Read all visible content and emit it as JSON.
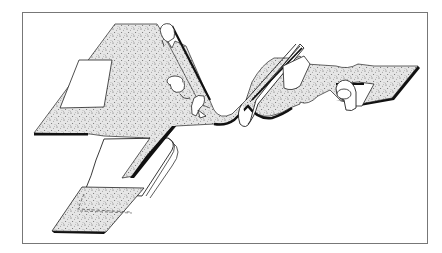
{
  "figure": {
    "colors": {
      "background": "#ffffff",
      "frame": "#777777",
      "ink": "#111111",
      "stipple_base": "#e9e9e9",
      "stipple_dot": "#555555"
    },
    "parts": [
      {
        "name": "main-sheet"
      },
      {
        "name": "window-cutout"
      },
      {
        "name": "pleat-fold"
      },
      {
        "name": "clip-top"
      },
      {
        "name": "clip-middle"
      },
      {
        "name": "clip-bottom"
      },
      {
        "name": "curled-strip"
      },
      {
        "name": "rolled-flap"
      },
      {
        "name": "lower-strip"
      },
      {
        "name": "lower-tab"
      }
    ]
  }
}
